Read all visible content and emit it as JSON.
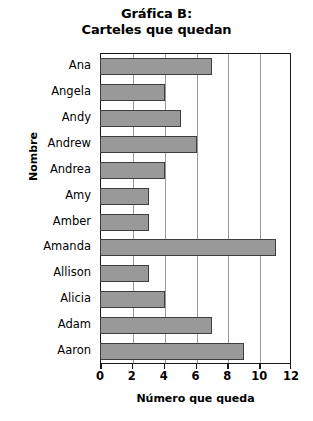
{
  "chart_data": {
    "type": "bar",
    "orientation": "horizontal",
    "title": "Gráfica B:",
    "subtitle": "Carteles que quedan",
    "xlabel": "Número que queda",
    "ylabel": "Nombre",
    "categories": [
      "Ana",
      "Angela",
      "Andy",
      "Andrew",
      "Andrea",
      "Amy",
      "Amber",
      "Amanda",
      "Allison",
      "Alicia",
      "Adam",
      "Aaron"
    ],
    "values": [
      7,
      4,
      5,
      6,
      4,
      3,
      3,
      11,
      3,
      4,
      7,
      9
    ],
    "xlim": [
      0,
      12
    ],
    "xticks": [
      0,
      2,
      4,
      6,
      8,
      10,
      12
    ],
    "grid": "vertical",
    "legend": "none",
    "bar_color": "#999999",
    "bar_border_color": "#3d3d3d",
    "axis_color": "#1a1a1a",
    "gridline_color": "#9a9a9a"
  }
}
